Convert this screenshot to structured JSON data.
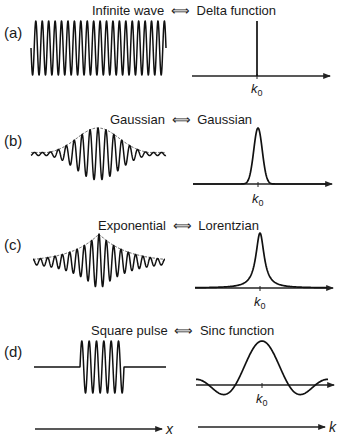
{
  "figure": {
    "panels": [
      {
        "id": "a",
        "letter": "(a)",
        "left_name": "Infinite wave",
        "arrow": "⟺",
        "right_name": "Delta function",
        "k0_label": "k",
        "k0_sub": "0",
        "wave": {
          "kind": "infinite",
          "x0": 31,
          "x1": 166,
          "baseline": 48,
          "amp": 27,
          "cycles": 21
        },
        "spectrum": {
          "kind": "delta",
          "axis_y": 76,
          "axis_x0": 192,
          "axis_x1": 330,
          "center": 257,
          "top": 21,
          "k0_y": 93
        },
        "title_y": 15,
        "letter_y": 38
      },
      {
        "id": "b",
        "letter": "(b)",
        "left_name": "Gaussian",
        "arrow": "⟺",
        "right_name": "Gaussian",
        "k0_label": "k",
        "k0_sub": "0",
        "wave": {
          "kind": "gaussian",
          "x0": 31,
          "x1": 166,
          "baseline": 154,
          "amp": 26,
          "cycles": 17,
          "center": 98,
          "width": 30
        },
        "spectrum": {
          "kind": "gaussian",
          "axis_y": 184,
          "axis_x0": 193,
          "axis_x1": 332,
          "center": 258,
          "top": 128,
          "width": 6,
          "k0_y": 203
        },
        "title_y": 124,
        "letter_y": 146
      },
      {
        "id": "c",
        "letter": "(c)",
        "left_name": "Exponential",
        "arrow": "⟺",
        "right_name": "Lorentzian",
        "k0_label": "k",
        "k0_sub": "0",
        "wave": {
          "kind": "exponential",
          "x0": 33,
          "x1": 165,
          "baseline": 262,
          "amp": 28,
          "cycles": 18,
          "center": 99,
          "decay": 28
        },
        "spectrum": {
          "kind": "lorentzian",
          "axis_y": 288,
          "axis_x0": 195,
          "axis_x1": 333,
          "center": 260,
          "top": 233,
          "width": 5,
          "k0_y": 306
        },
        "title_y": 230,
        "letter_y": 250
      },
      {
        "id": "d",
        "letter": "(d)",
        "left_name": "Square pulse",
        "arrow": "⟺",
        "right_name": "Sinc function",
        "k0_label": "k",
        "k0_sub": "0",
        "wave": {
          "kind": "square",
          "x0": 34,
          "x1": 166,
          "baseline": 367,
          "amp": 26,
          "cycles": 6,
          "pulse_x0": 80,
          "pulse_x1": 124
        },
        "spectrum": {
          "kind": "sinc",
          "axis_y": 385,
          "axis_x0": 196,
          "axis_x1": 334,
          "center": 262,
          "top": 341,
          "scale": 8.5,
          "k0_y": 403
        },
        "title_y": 335,
        "letter_y": 357
      }
    ],
    "bottom_axes": {
      "x_axis": {
        "label": "x",
        "x0": 35,
        "x1": 162,
        "y": 429
      },
      "k_axis": {
        "label": "k",
        "x0": 198,
        "x1": 325,
        "y": 427
      }
    }
  }
}
